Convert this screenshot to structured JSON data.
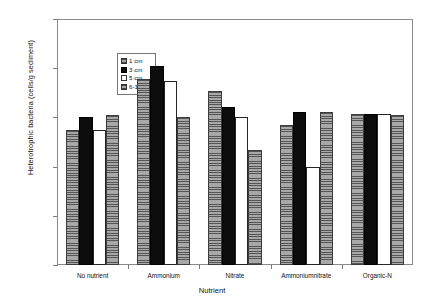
{
  "panel": {
    "label": "A"
  },
  "legend": {
    "position": "inside-top-left",
    "entries": [
      {
        "label": "1 cm",
        "swatch": "gray-hatched-swatch"
      },
      {
        "label": "3 cm",
        "swatch": "black-solid-swatch"
      },
      {
        "label": "5 cm",
        "swatch": "white-outline-swatch"
      },
      {
        "label": "6-10 cm",
        "swatch": "gray-hatched-swatch"
      }
    ]
  },
  "chart_data": {
    "type": "bar",
    "title": "",
    "xlabel": "Nutrient",
    "ylabel": "Heterotrophic bacteria (cells/g sediment)",
    "yscale": "log",
    "ylim": [
      10000,
      1000000000
    ],
    "ytick_labels": [
      "1.00E+09",
      "1.00E+08",
      "1.00E+07",
      "1.00E+06",
      "1.00E+05",
      "1.00E+04"
    ],
    "ytick_values": [
      1000000000,
      100000000,
      10000000,
      1000000,
      100000,
      10000
    ],
    "grid": false,
    "categories": [
      "No nutrient",
      "Ammonium",
      "Nitrate",
      "Ammoniumnitrate",
      "Organic-N"
    ],
    "series": [
      {
        "name": "1 cm",
        "values": [
          5500000,
          60000000,
          35000000,
          7000000,
          12000000
        ]
      },
      {
        "name": "3 cm",
        "values": [
          10000000,
          110000000,
          16000000,
          13000000,
          12000000
        ]
      },
      {
        "name": "5 cm",
        "values": [
          5500000,
          55000000,
          10000000,
          1000000,
          12000000
        ]
      },
      {
        "name": "6-10 cm",
        "values": [
          11000000,
          10000000,
          2200000,
          13000000,
          11000000
        ]
      }
    ]
  },
  "colors": {
    "series_1cm": "#a8a8a8",
    "series_3cm": "#0d0d0d",
    "series_5cm": "#ffffff",
    "series_6_10cm": "#a8a8a8",
    "axis": "#7d7d7d",
    "frame": "#8a8a8a",
    "text": "#111111"
  }
}
